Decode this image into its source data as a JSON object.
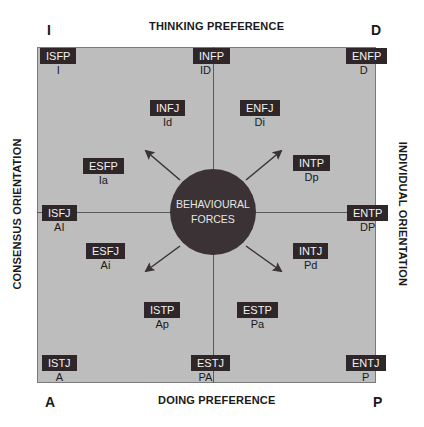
{
  "corners": {
    "top_left": "I",
    "top_right": "D",
    "bottom_left": "A",
    "bottom_right": "P"
  },
  "axes": {
    "top": "THINKING PREFERENCE",
    "bottom": "DOING PREFERENCE",
    "left": "CONSENSUS ORIENTATION",
    "right": "INDIVIDUAL ORIENTATION"
  },
  "center": {
    "line1": "BEHAVIOURAL",
    "line2": "FORCES"
  },
  "types": [
    {
      "type": "ISFP",
      "code": "I"
    },
    {
      "type": "INFP",
      "code": "ID"
    },
    {
      "type": "ENFP",
      "code": "D"
    },
    {
      "type": "INFJ",
      "code": "Id"
    },
    {
      "type": "ENFJ",
      "code": "Di"
    },
    {
      "type": "ESFP",
      "code": "Ia"
    },
    {
      "type": "INTP",
      "code": "Dp"
    },
    {
      "type": "ISFJ",
      "code": "AI"
    },
    {
      "type": "ENTP",
      "code": "DP"
    },
    {
      "type": "ESFJ",
      "code": "Ai"
    },
    {
      "type": "INTJ",
      "code": "Pd"
    },
    {
      "type": "ISTP",
      "code": "Ap"
    },
    {
      "type": "ESTP",
      "code": "Pa"
    },
    {
      "type": "ISTJ",
      "code": "A"
    },
    {
      "type": "ESTJ",
      "code": "PA"
    },
    {
      "type": "ENTJ",
      "code": "P"
    }
  ],
  "colors": {
    "field": "#bdbdbd",
    "box": "#2e2628",
    "circle": "#3a3234",
    "lines": "#5a5a5a"
  }
}
